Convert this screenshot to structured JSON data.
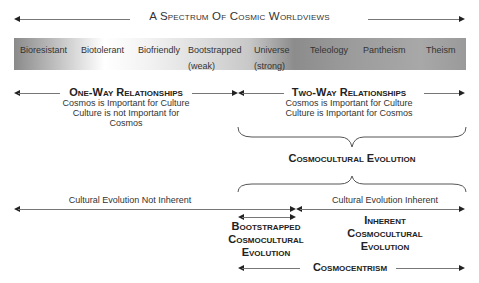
{
  "title": "A Spectrum Of Cosmic Worldviews",
  "spectrum": [
    {
      "label": "Bioresistant",
      "sub": ""
    },
    {
      "label": "Biotolerant",
      "sub": ""
    },
    {
      "label": "Biofriendly",
      "sub": ""
    },
    {
      "label": "Bootstrapped",
      "sub": "(weak)"
    },
    {
      "label": "Universe",
      "sub": "(strong)"
    },
    {
      "label": "Teleology",
      "sub": ""
    },
    {
      "label": "Pantheism",
      "sub": ""
    },
    {
      "label": "Theism",
      "sub": ""
    }
  ],
  "one_way": {
    "heading": "One-Way Relationships",
    "line1": "Cosmos is Important for Culture",
    "line2": "Culture is not Important for Cosmos"
  },
  "two_way": {
    "heading": "Two-Way Relationships",
    "line1": "Cosmos is Important for Culture",
    "line2": "Culture is Important for Cosmos"
  },
  "cosmocultural_evolution": "Cosmocultural Evolution",
  "not_inherent": "Cultural Evolution Not Inherent",
  "inherent": "Cultural Evolution Inherent",
  "bootstrapped_ce": {
    "line1": "Bootstrapped",
    "line2": "Cosmocultural",
    "line3": "Evolution"
  },
  "inherent_ce": {
    "line1": "Inherent",
    "line2": "Cosmocultural",
    "line3": "Evolution"
  },
  "cosmocentrism": "Cosmocentrism"
}
